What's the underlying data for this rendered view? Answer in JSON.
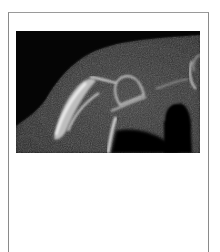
{
  "figure": {
    "image_alt": "CT scan of shoulder showing scapula and bone structures",
    "caption": ""
  },
  "colors": {
    "frame_border": "#8a8a8a",
    "scan_background": "#050505",
    "soft_tissue": "#3a3a3a",
    "bone": "#e6e6e6"
  }
}
